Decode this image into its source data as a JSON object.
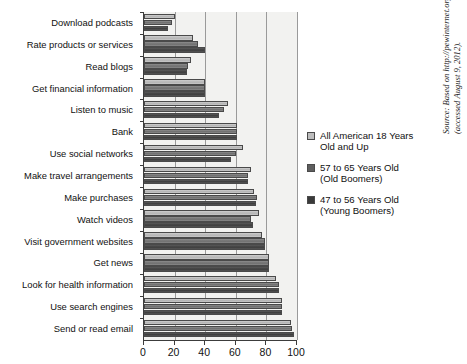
{
  "chart_data": {
    "type": "bar",
    "orientation": "horizontal",
    "title": "",
    "xlabel": "",
    "ylabel": "",
    "xlim": [
      0,
      100
    ],
    "xticks": [
      0,
      20,
      40,
      60,
      80,
      100
    ],
    "grid": true,
    "legend_position": "right",
    "categories": [
      "Download podcasts",
      "Rate products or services",
      "Read blogs",
      "Get financial information",
      "Listen to music",
      "Bank",
      "Use social networks",
      "Make travel arrangements",
      "Make purchases",
      "Watch videos",
      "Visit government websites",
      "Get news",
      "Look for health information",
      "Use search engines",
      "Send or read email"
    ],
    "series": [
      {
        "name": "All American 18 Years Old and Up",
        "color": "#bdbdbd",
        "values": [
          20,
          32,
          31,
          40,
          55,
          61,
          65,
          70,
          72,
          75,
          77,
          82,
          86,
          90,
          96
        ]
      },
      {
        "name": "57 to 65 Years Old (Old Boomers)",
        "color": "#5e5e5e",
        "values": [
          18,
          35,
          29,
          40,
          52,
          61,
          60,
          68,
          74,
          70,
          79,
          82,
          88,
          90,
          97
        ]
      },
      {
        "name": "47 to 56 Years Old (Young Boomers)",
        "color": "#3a3a3a",
        "values": [
          16,
          40,
          28,
          40,
          49,
          61,
          57,
          68,
          73,
          71,
          79,
          82,
          88,
          90,
          98
        ]
      }
    ]
  },
  "legend": {
    "entries": [
      {
        "line1": "All American 18 Years",
        "line2": "Old and Up"
      },
      {
        "line1": "57 to 65 Years Old",
        "line2": "(Old Boomers)"
      },
      {
        "line1": "47 to 56 Years Old",
        "line2": "(Young Boomers)"
      }
    ]
  },
  "axis": {
    "tick_labels": [
      "0",
      "20",
      "40",
      "60",
      "80",
      "100"
    ]
  },
  "source": {
    "line1": "Source: Based on http://pewinternet.org/Reports/2010/Generations-2011.aspx",
    "line2": "(accessed August 9, 2012)."
  }
}
